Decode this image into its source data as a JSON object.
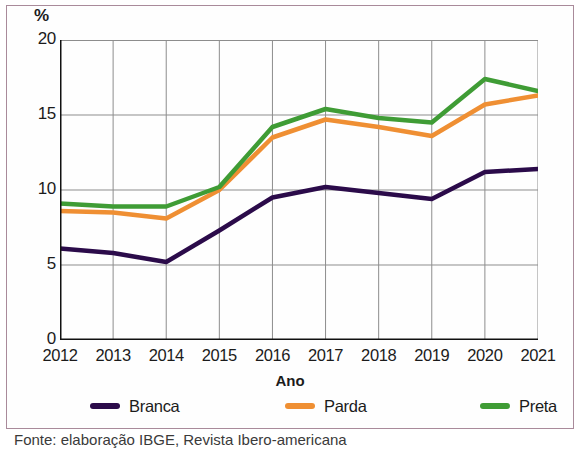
{
  "figure": {
    "y_unit_label": "%",
    "x_axis_title": "Ano",
    "source_prefix": "Fonte: Issuu com base ",
    "source_text": "Fonte: elaboração IBGE, Revista Ibero-americana"
  },
  "legend": {
    "position": "bottom",
    "items": [
      {
        "label": "Branca",
        "color": "#2b0b4a"
      },
      {
        "label": "Parda",
        "color": "#ef8f33"
      },
      {
        "label": "Preta",
        "color": "#3f9c35"
      }
    ]
  },
  "chart_data": {
    "type": "line",
    "title": "",
    "subtitle": "",
    "xlabel": "Ano",
    "ylabel": "%",
    "ylim": [
      0,
      20
    ],
    "yticks": [
      0,
      5,
      10,
      15,
      20
    ],
    "ytick_labels": [
      "0",
      "5",
      "10",
      "15",
      "20"
    ],
    "grid": true,
    "legend_position": "bottom",
    "categories": [
      "2012",
      "2013",
      "2014",
      "2015",
      "2016",
      "2017",
      "2018",
      "2019",
      "2020",
      "2021"
    ],
    "x": [
      2012,
      2013,
      2014,
      2015,
      2016,
      2017,
      2018,
      2019,
      2020,
      2021
    ],
    "series": [
      {
        "name": "Branca",
        "color": "#2b0b4a",
        "values": [
          6.1,
          5.8,
          5.2,
          7.3,
          9.5,
          10.2,
          9.8,
          9.4,
          11.2,
          11.4
        ]
      },
      {
        "name": "Parda",
        "color": "#ef8f33",
        "values": [
          8.6,
          8.5,
          8.1,
          10.0,
          13.5,
          14.7,
          14.2,
          13.6,
          15.7,
          16.3
        ]
      },
      {
        "name": "Preta",
        "color": "#3f9c35",
        "values": [
          9.1,
          8.9,
          8.9,
          10.2,
          14.2,
          15.4,
          14.8,
          14.5,
          17.4,
          16.6
        ]
      }
    ]
  }
}
